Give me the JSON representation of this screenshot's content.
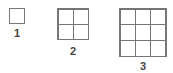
{
  "figures": [
    {
      "label": "1",
      "size": 1
    },
    {
      "label": "2",
      "size": 2
    },
    {
      "label": "3",
      "size": 3
    }
  ],
  "colors": {
    "line": "#777777",
    "text": "#444444",
    "background": "#ffffff"
  }
}
